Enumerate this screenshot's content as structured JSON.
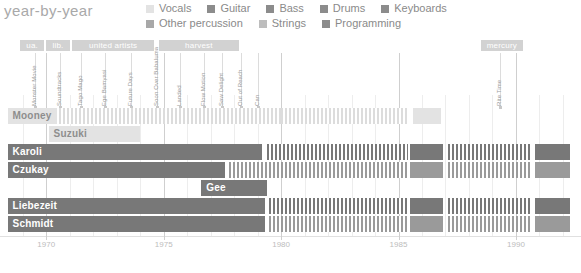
{
  "title": "year-by-year",
  "legend": {
    "rows": [
      [
        {
          "label": "Vocals",
          "color": "#e3e3e3"
        },
        {
          "label": "Guitar",
          "color": "#8c8c8c"
        },
        {
          "label": "Bass",
          "color": "#8c8c8c"
        },
        {
          "label": "Drums",
          "color": "#8c8c8c"
        },
        {
          "label": "Keyboards",
          "color": "#8c8c8c"
        }
      ],
      [
        {
          "label": "Other percussion",
          "color": "#a8a8a8"
        },
        {
          "label": "Strings",
          "color": "#bdbdbd"
        },
        {
          "label": "Programming",
          "color": "#8c8c8c"
        }
      ]
    ]
  },
  "chart_data": {
    "type": "bar",
    "title": "year-by-year",
    "xlabel": "",
    "ylabel": "",
    "xlim": [
      1968.2,
      1992.6
    ],
    "grid": true,
    "legend_position": "top",
    "tick_labels": [
      "1970",
      "1975",
      "1980",
      "1985",
      "1990"
    ],
    "ticks": [
      1970,
      1975,
      1980,
      1985,
      1990
    ],
    "minor_ticks": [
      1969,
      1971,
      1972,
      1973,
      1974,
      1976,
      1977,
      1978,
      1979,
      1981,
      1982,
      1983,
      1984,
      1986,
      1987,
      1988,
      1989,
      1991,
      1992
    ],
    "eras": [
      {
        "label": "ua.",
        "start": 1968.9,
        "end": 1969.9
      },
      {
        "label": "lib.",
        "start": 1970.0,
        "end": 1971.0
      },
      {
        "label": "united artists",
        "start": 1971.1,
        "end": 1974.6
      },
      {
        "label": "harvest",
        "start": 1974.8,
        "end": 1978.2
      },
      {
        "label": "mercury",
        "start": 1988.5,
        "end": 1990.3
      }
    ],
    "albums": [
      {
        "name": "Monster Movie",
        "year": 1969.5
      },
      {
        "name": "Soundtracks",
        "year": 1970.6
      },
      {
        "name": "Tago Mago",
        "year": 1971.5
      },
      {
        "name": "Ege Bamyasi",
        "year": 1972.5
      },
      {
        "name": "Future Days",
        "year": 1973.6
      },
      {
        "name": "Soon Over Babaluma",
        "year": 1974.7
      },
      {
        "name": "Landed",
        "year": 1975.7
      },
      {
        "name": "Flow Motion",
        "year": 1976.7
      },
      {
        "name": "Saw Delight",
        "year": 1977.5
      },
      {
        "name": "Out of Reach",
        "year": 1978.3
      },
      {
        "name": "Can",
        "year": 1979.0
      },
      {
        "name": "Rite Time",
        "year": 1989.3
      }
    ],
    "members": [
      "Mooney",
      "Suzuki",
      "Karoli",
      "Czukay",
      "Gee",
      "Liebezeit",
      "Schmidt"
    ],
    "series": [
      {
        "name": "Mooney",
        "tag_style": "on-light",
        "tag_start": 1968.35,
        "segments": [
          {
            "start": 1969.5,
            "end": 1980.0,
            "style": "hatch-light"
          },
          {
            "start": 1980.0,
            "end": 1985.4,
            "style": "hatch-light"
          },
          {
            "start": 1985.6,
            "end": 1986.8,
            "style": "solid-light"
          }
        ]
      },
      {
        "name": "Suzuki",
        "tag_style": "on-light",
        "tag_start": 1970.1,
        "segments": [
          {
            "start": 1970.1,
            "end": 1974.0,
            "style": "solid-light"
          }
        ]
      },
      {
        "name": "Karoli",
        "tag_style": "on-dark",
        "tag_start": 1968.35,
        "segments": [
          {
            "start": 1968.35,
            "end": 1979.2,
            "style": "solid-dark"
          },
          {
            "start": 1979.4,
            "end": 1985.4,
            "style": "hatch-dark"
          },
          {
            "start": 1985.5,
            "end": 1986.9,
            "style": "solid-dark"
          },
          {
            "start": 1987.1,
            "end": 1990.6,
            "style": "hatch-dark"
          },
          {
            "start": 1990.8,
            "end": 1992.3,
            "style": "solid-dark"
          }
        ]
      },
      {
        "name": "Czukay",
        "tag_style": "on-dark",
        "tag_start": 1968.35,
        "segments": [
          {
            "start": 1968.35,
            "end": 1977.6,
            "style": "solid-dark"
          },
          {
            "start": 1977.8,
            "end": 1985.4,
            "style": "hatch-mid"
          },
          {
            "start": 1985.5,
            "end": 1986.9,
            "style": "solid-mid"
          },
          {
            "start": 1987.1,
            "end": 1990.6,
            "style": "hatch-mid"
          },
          {
            "start": 1990.8,
            "end": 1992.3,
            "style": "solid-mid"
          }
        ]
      },
      {
        "name": "Gee",
        "tag_style": "on-dark",
        "tag_start": 1976.6,
        "segments": [
          {
            "start": 1976.6,
            "end": 1979.4,
            "style": "solid-dark"
          }
        ]
      },
      {
        "name": "Liebezeit",
        "tag_style": "on-dark",
        "tag_start": 1968.35,
        "segments": [
          {
            "start": 1968.35,
            "end": 1979.3,
            "style": "solid-dark"
          },
          {
            "start": 1979.5,
            "end": 1985.4,
            "style": "hatch-dark"
          },
          {
            "start": 1985.5,
            "end": 1986.9,
            "style": "solid-dark"
          },
          {
            "start": 1987.1,
            "end": 1990.6,
            "style": "hatch-dark"
          },
          {
            "start": 1990.8,
            "end": 1992.3,
            "style": "solid-dark"
          }
        ]
      },
      {
        "name": "Schmidt",
        "tag_style": "on-dark",
        "tag_start": 1968.35,
        "segments": [
          {
            "start": 1968.35,
            "end": 1979.3,
            "style": "solid-dark"
          },
          {
            "start": 1979.5,
            "end": 1985.4,
            "style": "hatch-mid"
          },
          {
            "start": 1985.5,
            "end": 1986.9,
            "style": "solid-mid"
          },
          {
            "start": 1987.1,
            "end": 1990.6,
            "style": "hatch-mid"
          },
          {
            "start": 1990.8,
            "end": 1992.3,
            "style": "solid-mid"
          }
        ]
      }
    ]
  }
}
